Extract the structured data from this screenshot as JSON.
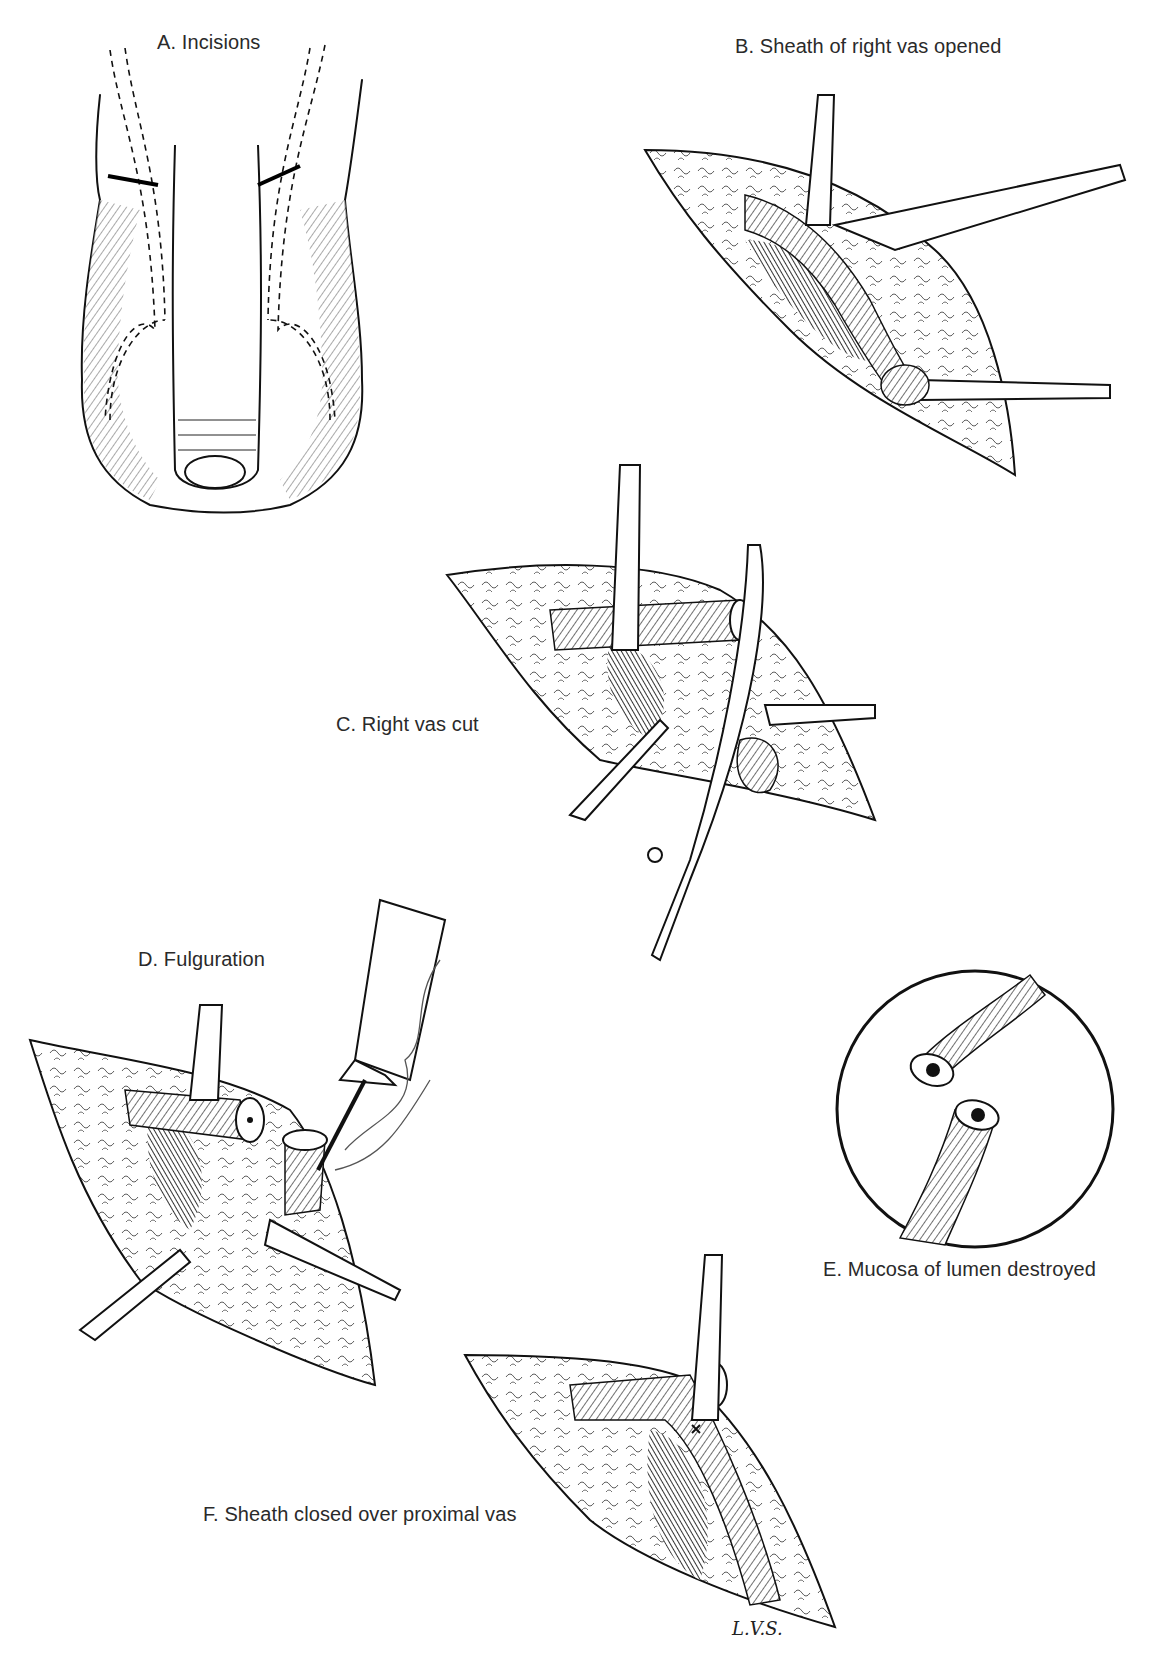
{
  "figure": {
    "type": "surgical-illustration",
    "panels": [
      {
        "id": "A",
        "label": "A. Incisions"
      },
      {
        "id": "B",
        "label": "B. Sheath of right vas opened"
      },
      {
        "id": "C",
        "label": "C. Right vas cut"
      },
      {
        "id": "D",
        "label": "D. Fulguration"
      },
      {
        "id": "E",
        "label": "E. Mucosa of lumen destroyed"
      },
      {
        "id": "F",
        "label": "F. Sheath closed over proximal vas"
      }
    ],
    "signature": "L.V.S."
  }
}
